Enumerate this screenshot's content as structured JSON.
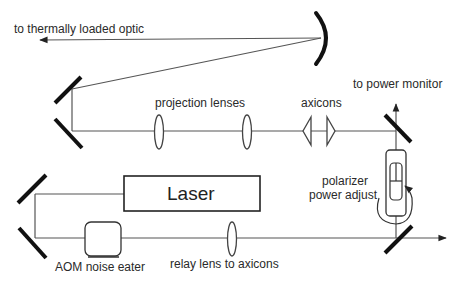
{
  "diagram": {
    "labels": {
      "thermal_optic": "to thermally loaded optic",
      "projection_lenses": "projection lenses",
      "axicons": "axicons",
      "power_monitor": "to power monitor",
      "polarizer_line1": "polarizer",
      "polarizer_line2": "power adjust",
      "laser": "Laser",
      "aom": "AOM noise eater",
      "relay_lens": "relay lens to axicons"
    },
    "components": [
      {
        "id": "laser",
        "type": "laser-source"
      },
      {
        "id": "aom",
        "type": "acousto-optic-modulator"
      },
      {
        "id": "relay-lens",
        "type": "lens"
      },
      {
        "id": "polarizer",
        "type": "rotatable-polarizer"
      },
      {
        "id": "beam-splitter-lower",
        "type": "mirror"
      },
      {
        "id": "beam-splitter-upper",
        "type": "mirror"
      },
      {
        "id": "axicon-1",
        "type": "axicon"
      },
      {
        "id": "axicon-2",
        "type": "axicon"
      },
      {
        "id": "projection-lens-1",
        "type": "lens"
      },
      {
        "id": "projection-lens-2",
        "type": "lens"
      },
      {
        "id": "curved-mirror",
        "type": "concave-mirror"
      },
      {
        "id": "fold-mirrors-top",
        "type": "mirror-pair"
      },
      {
        "id": "fold-mirrors-bottom",
        "type": "mirror-pair"
      }
    ],
    "colors": {
      "line": "#555555",
      "mirror": "#111111",
      "text": "#2a2a2a"
    }
  }
}
